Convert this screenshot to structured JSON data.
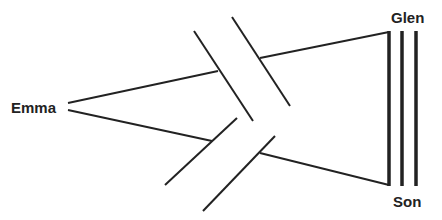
{
  "diagram": {
    "type": "genogram-relationship",
    "nodes": [
      {
        "id": "emma",
        "label": "Emma"
      },
      {
        "id": "glen",
        "label": "Glen"
      },
      {
        "id": "son",
        "label": "Son"
      }
    ],
    "edges": [
      {
        "from": "emma",
        "to": "glen",
        "style": "cut-off",
        "description": "line interrupted by double slash break"
      },
      {
        "from": "emma",
        "to": "son",
        "style": "cut-off",
        "description": "line interrupted by double slash break"
      },
      {
        "from": "glen",
        "to": "son",
        "style": "fused",
        "description": "triple parallel lines"
      }
    ],
    "colors": {
      "line": "#222222",
      "background": "#ffffff"
    }
  }
}
